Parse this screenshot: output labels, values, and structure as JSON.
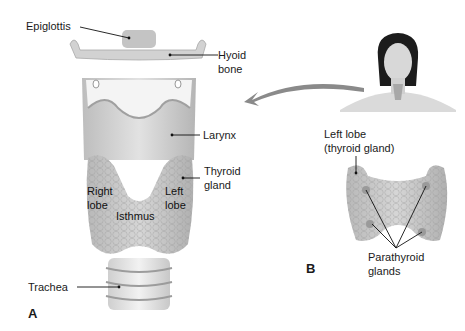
{
  "figure": {
    "panel_a": {
      "letter": "A",
      "labels": {
        "epiglottis": "Epiglottis",
        "hyoid_line1": "Hyoid",
        "hyoid_line2": "bone",
        "larynx": "Larynx",
        "thyroid_line1": "Thyroid",
        "thyroid_line2": "gland",
        "right_lobe_line1": "Right",
        "right_lobe_line2": "lobe",
        "left_lobe_line1": "Left",
        "left_lobe_line2": "lobe",
        "isthmus": "Isthmus",
        "trachea": "Trachea"
      }
    },
    "panel_b": {
      "letter": "B",
      "labels": {
        "left_lobe_line1": "Left lobe",
        "left_lobe_line2": "(thyroid gland)",
        "parathyroid_line1": "Parathyroid",
        "parathyroid_line2": "glands"
      }
    },
    "colors": {
      "tissue_light": "#e6e6e6",
      "tissue_mid": "#cfcfcf",
      "tissue_dark": "#a8a8a8",
      "leader_line": "#111111",
      "arrow": "#8a8a8a",
      "hair": "#1c1c1c",
      "skin": "#dadada"
    }
  }
}
